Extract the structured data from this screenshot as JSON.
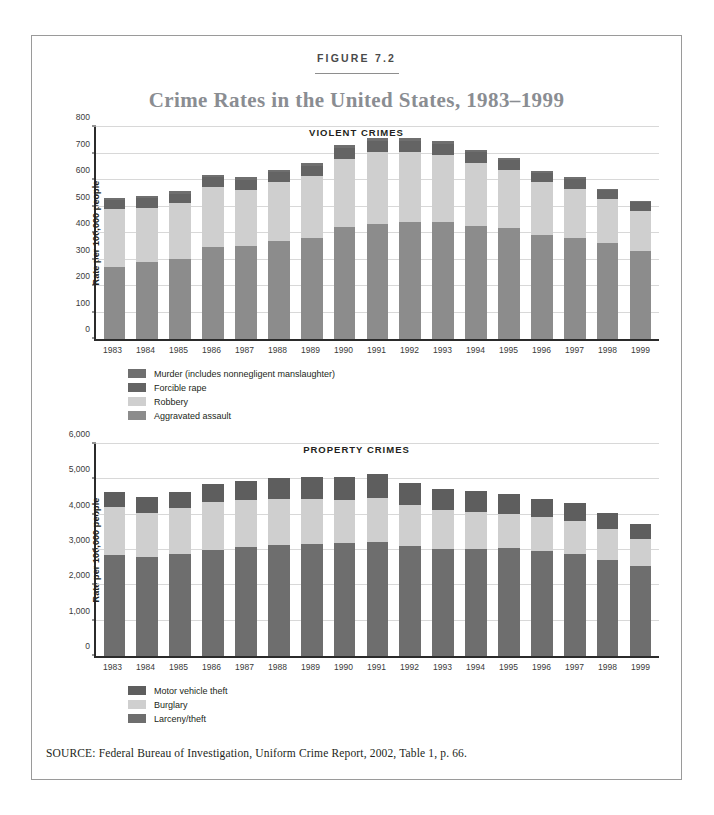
{
  "figure": {
    "label": "FIGURE 7.2",
    "title": "Crime Rates in the United States, 1983–1999",
    "source": "SOURCE:  Federal Bureau of Investigation, Uniform Crime Report, 2002, Table 1, p. 66."
  },
  "colors": {
    "murder": "#6f6f6f",
    "forcible_rape": "#646464",
    "robbery": "#cfcfcf",
    "aggravated_assault": "#8c8c8c",
    "motor_vehicle_theft": "#5e5e5e",
    "burglary": "#cfcfcf",
    "larceny_theft": "#6e6e6e",
    "axis": "#2b2b2b",
    "grid": "#d8d8d8",
    "title_gray": "#8a8d92",
    "border": "#9a9a9a"
  },
  "chart_data": [
    {
      "type": "bar",
      "stacked": true,
      "title": "VIOLENT CRIMES",
      "xlabel": "",
      "ylabel": "Rate per 100,000 people",
      "ylim": [
        0,
        800
      ],
      "yticks": [
        0,
        100,
        200,
        300,
        400,
        500,
        600,
        700,
        800
      ],
      "ytick_labels": [
        "0",
        "100",
        "200",
        "300",
        "400",
        "500",
        "600",
        "700",
        "800"
      ],
      "grid": true,
      "legend_position": "below",
      "categories": [
        "1983",
        "1984",
        "1985",
        "1986",
        "1987",
        "1988",
        "1989",
        "1990",
        "1991",
        "1992",
        "1993",
        "1994",
        "1995",
        "1996",
        "1997",
        "1998",
        "1999"
      ],
      "series": [
        {
          "name": "Aggravated assault",
          "color": "#8c8c8c",
          "values": [
            273,
            290,
            303,
            346,
            351,
            370,
            383,
            424,
            433,
            442,
            440,
            427,
            418,
            391,
            382,
            361,
            334
          ]
        },
        {
          "name": "Robbery",
          "color": "#cfcfcf",
          "values": [
            217,
            205,
            209,
            226,
            213,
            221,
            233,
            257,
            273,
            264,
            256,
            238,
            221,
            201,
            186,
            166,
            150
          ]
        },
        {
          "name": "Forcible rape",
          "color": "#646464",
          "values": [
            34,
            36,
            37,
            38,
            38,
            38,
            38,
            41,
            42,
            43,
            41,
            39,
            37,
            36,
            36,
            34,
            32
          ]
        },
        {
          "name": "Murder (includes nonnegligent manslaughter)",
          "color": "#6f6f6f",
          "values": [
            8,
            8,
            8,
            9,
            8,
            8,
            9,
            9,
            10,
            9,
            10,
            9,
            8,
            7,
            7,
            6,
            6
          ]
        }
      ],
      "totals": [
        532,
        539,
        557,
        619,
        610,
        637,
        663,
        731,
        758,
        758,
        747,
        713,
        684,
        635,
        611,
        567,
        522
      ]
    },
    {
      "type": "bar",
      "stacked": true,
      "title": "PROPERTY CRIMES",
      "xlabel": "",
      "ylabel": "Rate per 100,000 people",
      "ylim": [
        0,
        6000
      ],
      "yticks": [
        0,
        1000,
        2000,
        3000,
        4000,
        5000,
        6000
      ],
      "ytick_labels": [
        "0",
        "1,000",
        "2,000",
        "3,000",
        "4,000",
        "5,000",
        "6,000"
      ],
      "grid": true,
      "legend_position": "below",
      "categories": [
        "1983",
        "1984",
        "1985",
        "1986",
        "1987",
        "1988",
        "1989",
        "1990",
        "1991",
        "1992",
        "1993",
        "1994",
        "1995",
        "1996",
        "1997",
        "1998",
        "1999"
      ],
      "series": [
        {
          "name": "Larceny/theft",
          "color": "#6e6e6e",
          "values": [
            2869,
            2791,
            2901,
            3010,
            3081,
            3135,
            3171,
            3185,
            3229,
            3103,
            3034,
            3026,
            3044,
            2980,
            2892,
            2729,
            2551
          ]
        },
        {
          "name": "Burglary",
          "color": "#cfcfcf",
          "values": [
            1338,
            1264,
            1287,
            1345,
            1330,
            1309,
            1276,
            1236,
            1252,
            1168,
            1100,
            1042,
            987,
            945,
            919,
            863,
            770
          ]
        },
        {
          "name": "Motor vehicle theft",
          "color": "#5e5e5e",
          "values": [
            431,
            437,
            463,
            508,
            529,
            583,
            631,
            656,
            659,
            632,
            606,
            591,
            560,
            526,
            506,
            460,
            422
          ]
        }
      ],
      "totals": [
        4638,
        4492,
        4651,
        4863,
        4940,
        5027,
        5078,
        5077,
        5140,
        4903,
        4740,
        4659,
        4591,
        4451,
        4317,
        4052,
        3743
      ]
    }
  ]
}
